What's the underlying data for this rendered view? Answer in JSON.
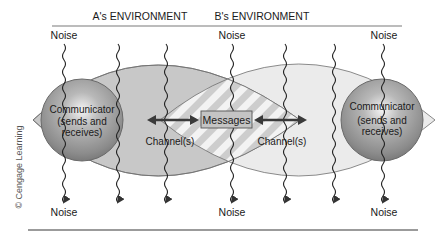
{
  "figure": {
    "type": "communication-model-diagram",
    "environments": [
      {
        "label": "A's ENVIRONMENT"
      },
      {
        "label": "B's ENVIRONMENT"
      }
    ],
    "communicators": [
      {
        "name": "Communicator",
        "detail_line1": "(sends and",
        "detail_line2": "receives)"
      },
      {
        "name": "Communicator",
        "detail_line1": "(sends and",
        "detail_line2": "receives)"
      }
    ],
    "center": {
      "label": "Messages"
    },
    "channels": [
      {
        "label": "Channel(s)"
      },
      {
        "label": "Channel(s)"
      }
    ],
    "noise_top": [
      "Noise",
      "Noise",
      "Noise"
    ],
    "noise_bottom": [
      "Noise",
      "Noise",
      "Noise"
    ],
    "credit": "© Cengage Learning",
    "colors": {
      "left_lens": "#c9c9c9",
      "right_lens": "#ececec",
      "sphere": "#9a9a9a",
      "hatch_light": "#f2f2f2",
      "hatch_dark": "#cfcfcf",
      "message_box": "#bdbdbd",
      "arrow": "#3a3a3a",
      "rule": "#7a7a7a"
    }
  }
}
